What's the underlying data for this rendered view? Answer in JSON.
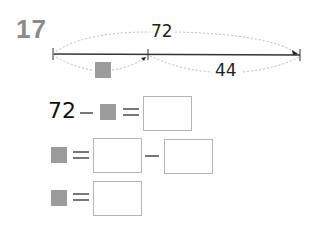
{
  "problem": {
    "number": "17"
  },
  "diagram": {
    "total_label": "72",
    "part_label": "44",
    "unknown_part": "gray-square"
  },
  "equations": [
    {
      "left": "72",
      "op1": "−",
      "mid": "gray-square",
      "op2": "=",
      "answer_boxes": 1
    },
    {
      "left": "gray-square",
      "op1": "=",
      "answer_boxes": 2,
      "between": "−"
    },
    {
      "left": "gray-square",
      "op1": "=",
      "answer_boxes": 1
    }
  ],
  "colors": {
    "number": "#8a8a8a",
    "square": "#9b9b9b",
    "box_border": "#b5b5b5",
    "line": "#333333",
    "dotted": "#bbbbbb"
  }
}
